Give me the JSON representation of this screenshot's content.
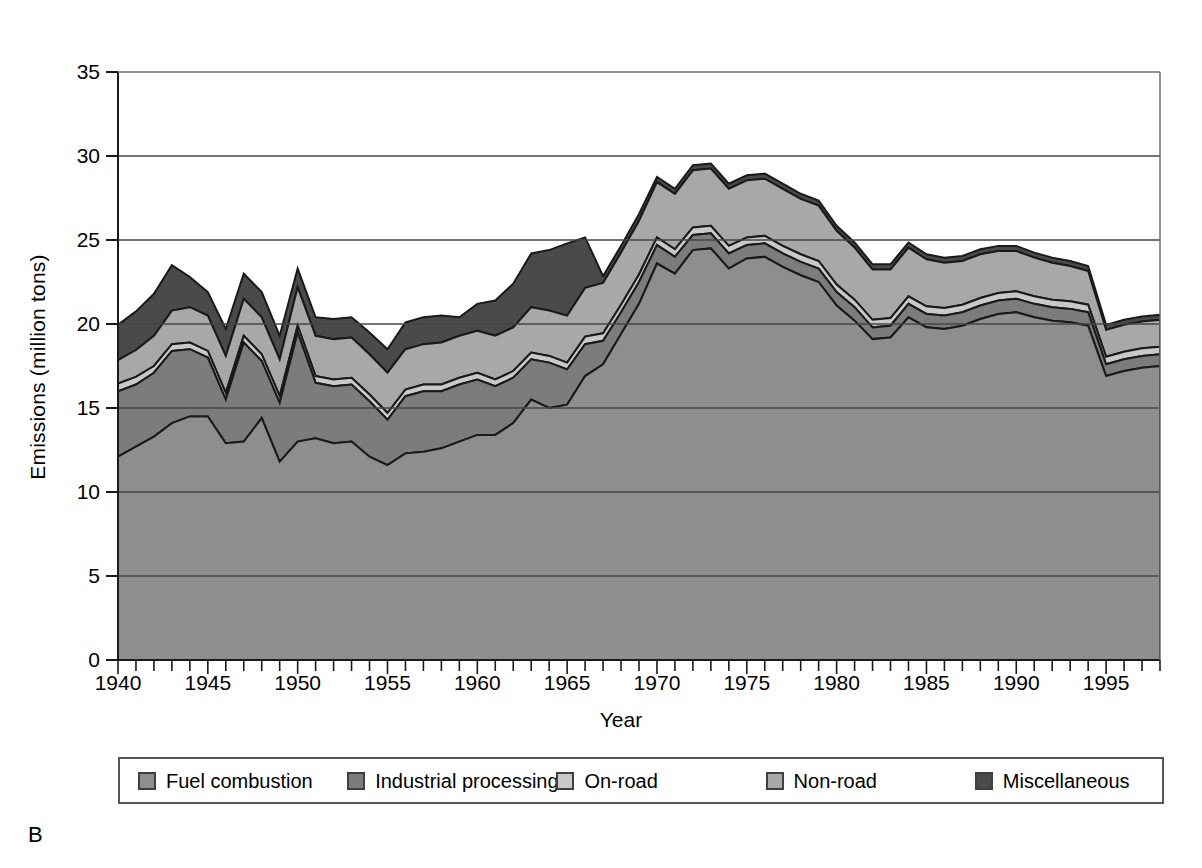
{
  "panel": {
    "letter": "B"
  },
  "axes": {
    "ylabel": "Emissions (million tons)",
    "xlabel": "Year",
    "yticks": [
      "0",
      "5",
      "10",
      "15",
      "20",
      "25",
      "30",
      "35"
    ],
    "xticks": [
      "1940",
      "1945",
      "1950",
      "1955",
      "1960",
      "1965",
      "1970",
      "1975",
      "1980",
      "1985",
      "1990",
      "1995"
    ]
  },
  "legend": {
    "items": [
      {
        "label": "Fuel combustion",
        "color": "#8e8e8e"
      },
      {
        "label": "Industrial processing",
        "color": "#7c7c7c"
      },
      {
        "label": "On-road",
        "color": "#c9c9c9"
      },
      {
        "label": "Non-road",
        "color": "#a8a8a8"
      },
      {
        "label": "Miscellaneous",
        "color": "#4a4a4a"
      }
    ]
  },
  "chart_data": {
    "type": "area",
    "stacked": true,
    "title": "",
    "xlabel": "Year",
    "ylabel": "Emissions (million tons)",
    "xlim": [
      1940,
      1998
    ],
    "ylim": [
      0,
      35
    ],
    "ytick_step": 5,
    "xtick_step": 1,
    "xtick_label_step": 5,
    "grid": "horizontal",
    "legend_position": "bottom",
    "x": [
      1940,
      1941,
      1942,
      1943,
      1944,
      1945,
      1946,
      1947,
      1948,
      1949,
      1950,
      1951,
      1952,
      1953,
      1954,
      1955,
      1956,
      1957,
      1958,
      1959,
      1960,
      1961,
      1962,
      1963,
      1964,
      1965,
      1966,
      1967,
      1968,
      1969,
      1970,
      1971,
      1972,
      1973,
      1974,
      1975,
      1976,
      1977,
      1978,
      1979,
      1980,
      1981,
      1982,
      1983,
      1984,
      1985,
      1986,
      1987,
      1988,
      1989,
      1990,
      1991,
      1992,
      1993,
      1994,
      1995,
      1996,
      1997,
      1998
    ],
    "series": [
      {
        "name": "Fuel combustion",
        "color": "#8e8e8e",
        "values": [
          12.1,
          12.7,
          13.3,
          14.1,
          14.5,
          14.5,
          12.9,
          13.0,
          14.4,
          11.8,
          13.0,
          13.2,
          12.9,
          13.0,
          12.1,
          11.6,
          12.3,
          12.4,
          12.6,
          13.0,
          13.4,
          13.4,
          14.1,
          15.5,
          15.0,
          15.2,
          16.9,
          17.6,
          19.4,
          21.2,
          23.6,
          23.0,
          24.4,
          24.5,
          23.3,
          23.9,
          24.0,
          23.4,
          22.9,
          22.5,
          21.1,
          20.2,
          19.1,
          19.2,
          20.4,
          19.8,
          19.7,
          19.9,
          20.3,
          20.6,
          20.7,
          20.4,
          20.2,
          20.1,
          19.9,
          16.9,
          17.2,
          17.4,
          17.5
        ]
      },
      {
        "name": "Industrial processing",
        "color": "#7c7c7c",
        "values": [
          3.9,
          3.7,
          3.8,
          4.3,
          4.0,
          3.5,
          2.6,
          5.9,
          3.4,
          3.5,
          6.5,
          3.3,
          3.4,
          3.4,
          3.3,
          2.7,
          3.4,
          3.6,
          3.4,
          3.4,
          3.3,
          2.9,
          2.7,
          2.4,
          2.7,
          2.1,
          1.9,
          1.4,
          1.3,
          1.3,
          1.1,
          1.0,
          0.9,
          0.9,
          0.9,
          0.8,
          0.8,
          0.8,
          0.8,
          0.8,
          0.8,
          0.8,
          0.7,
          0.7,
          0.8,
          0.8,
          0.8,
          0.8,
          0.8,
          0.8,
          0.8,
          0.8,
          0.8,
          0.8,
          0.8,
          0.7,
          0.7,
          0.7,
          0.7
        ]
      },
      {
        "name": "On-road",
        "color": "#c9c9c9",
        "values": [
          0.45,
          0.45,
          0.4,
          0.4,
          0.4,
          0.4,
          0.4,
          0.4,
          0.4,
          0.4,
          0.4,
          0.4,
          0.4,
          0.4,
          0.4,
          0.4,
          0.4,
          0.4,
          0.4,
          0.4,
          0.4,
          0.4,
          0.4,
          0.4,
          0.4,
          0.4,
          0.45,
          0.45,
          0.45,
          0.45,
          0.45,
          0.45,
          0.45,
          0.45,
          0.45,
          0.45,
          0.45,
          0.45,
          0.45,
          0.45,
          0.45,
          0.45,
          0.45,
          0.45,
          0.45,
          0.45,
          0.45,
          0.45,
          0.45,
          0.45,
          0.45,
          0.45,
          0.45,
          0.45,
          0.45,
          0.45,
          0.45,
          0.45,
          0.45
        ]
      },
      {
        "name": "Non-road",
        "color": "#a8a8a8",
        "values": [
          1.4,
          1.6,
          1.8,
          2.0,
          2.1,
          2.1,
          2.2,
          2.2,
          2.2,
          2.2,
          2.3,
          2.4,
          2.4,
          2.4,
          2.4,
          2.4,
          2.4,
          2.4,
          2.5,
          2.5,
          2.5,
          2.6,
          2.6,
          2.7,
          2.7,
          2.8,
          2.9,
          3.0,
          3.1,
          3.2,
          3.3,
          3.3,
          3.4,
          3.4,
          3.4,
          3.4,
          3.4,
          3.4,
          3.3,
          3.3,
          3.2,
          3.1,
          3.0,
          2.9,
          2.9,
          2.8,
          2.7,
          2.6,
          2.6,
          2.5,
          2.4,
          2.3,
          2.2,
          2.1,
          2.0,
          1.6,
          1.6,
          1.6,
          1.6
        ]
      },
      {
        "name": "Miscellaneous",
        "color": "#4a4a4a",
        "values": [
          2.1,
          2.3,
          2.5,
          2.7,
          1.8,
          1.4,
          1.6,
          1.5,
          1.5,
          1.4,
          1.1,
          1.1,
          1.2,
          1.2,
          1.3,
          1.4,
          1.6,
          1.6,
          1.6,
          1.1,
          1.6,
          2.1,
          2.6,
          3.2,
          3.6,
          4.3,
          3.0,
          0.4,
          0.4,
          0.4,
          0.3,
          0.3,
          0.3,
          0.3,
          0.3,
          0.3,
          0.3,
          0.3,
          0.3,
          0.3,
          0.3,
          0.3,
          0.3,
          0.3,
          0.3,
          0.3,
          0.3,
          0.3,
          0.3,
          0.3,
          0.3,
          0.3,
          0.3,
          0.3,
          0.3,
          0.3,
          0.3,
          0.3,
          0.3
        ]
      }
    ],
    "totals": [
      19.95,
      20.75,
      21.8,
      23.5,
      22.8,
      21.9,
      19.7,
      23.0,
      21.9,
      19.3,
      23.3,
      20.4,
      20.3,
      20.4,
      19.5,
      18.5,
      20.1,
      20.4,
      20.5,
      20.4,
      21.2,
      21.4,
      22.4,
      24.2,
      24.4,
      24.8,
      25.15,
      22.85,
      24.65,
      26.55,
      28.75,
      28.05,
      29.45,
      29.55,
      28.35,
      28.85,
      28.95,
      28.35,
      27.75,
      27.35,
      25.85,
      24.85,
      23.55,
      23.55,
      24.85,
      24.15,
      23.95,
      24.05,
      24.45,
      24.65,
      24.65,
      24.25,
      23.95,
      23.75,
      23.45,
      19.95,
      20.25,
      20.45,
      20.55
    ]
  }
}
